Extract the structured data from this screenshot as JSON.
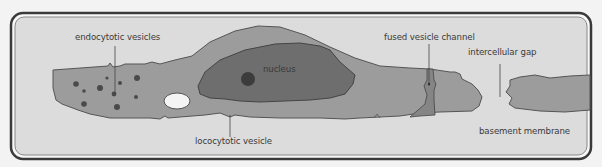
{
  "diagram": {
    "type": "cell cross-section (endothelial cell)",
    "labels": {
      "endocytotic_vesicles": "endocytotic vesicles",
      "nucleus": "nucleus",
      "fused_vesicle_channel": "fused vesicle channel",
      "intercellular_gap": "intercellular gap",
      "lococytotic_vesicle": "lococytotic vesicle",
      "basement_membrane": "basement membrane"
    },
    "colors": {
      "background": "#dcdcdc",
      "cell_cytoplasm": "#9c9c9c",
      "nucleus": "#6e6e6e",
      "nucleolus": "#3c3c3c",
      "vesicles": "#4a4a4a",
      "frame": "#3a3a3a"
    }
  }
}
